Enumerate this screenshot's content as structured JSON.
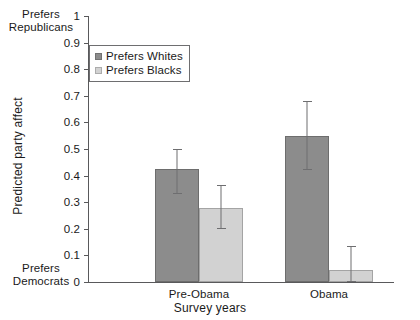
{
  "chart_data": {
    "type": "bar",
    "title": "",
    "xlabel": "Survey years",
    "ylabel": "Predicted party affect",
    "categories": [
      "Pre-Obama",
      "Obama"
    ],
    "ylim": [
      0,
      1
    ],
    "yticks": [
      "0",
      "0.1",
      "0.2",
      "0.3",
      "0.4",
      "0.5",
      "0.6",
      "0.7",
      "0.8",
      "0.9",
      "1"
    ],
    "grid": false,
    "legend_position": "upper-left-inside",
    "series": [
      {
        "name": "Prefers Whites",
        "color": "#8c8c8c",
        "values": [
          0.425,
          0.55
        ],
        "err_low": [
          0.33,
          0.42
        ],
        "err_high": [
          0.5,
          0.68
        ]
      },
      {
        "name": "Prefers Blacks",
        "color": "#d2d2d2",
        "values": [
          0.28,
          0.045
        ],
        "err_low": [
          0.2,
          0.0
        ],
        "err_high": [
          0.365,
          0.135
        ]
      }
    ],
    "annotations": [
      {
        "name": "axis-top-anchor",
        "text": "Prefers\nRepublicans",
        "line1": "Prefers",
        "line2": "Republicans"
      },
      {
        "name": "axis-bottom-anchor",
        "text": "Prefers\nDemocrats",
        "line1": "Prefers",
        "line2": "Democrats"
      }
    ]
  }
}
